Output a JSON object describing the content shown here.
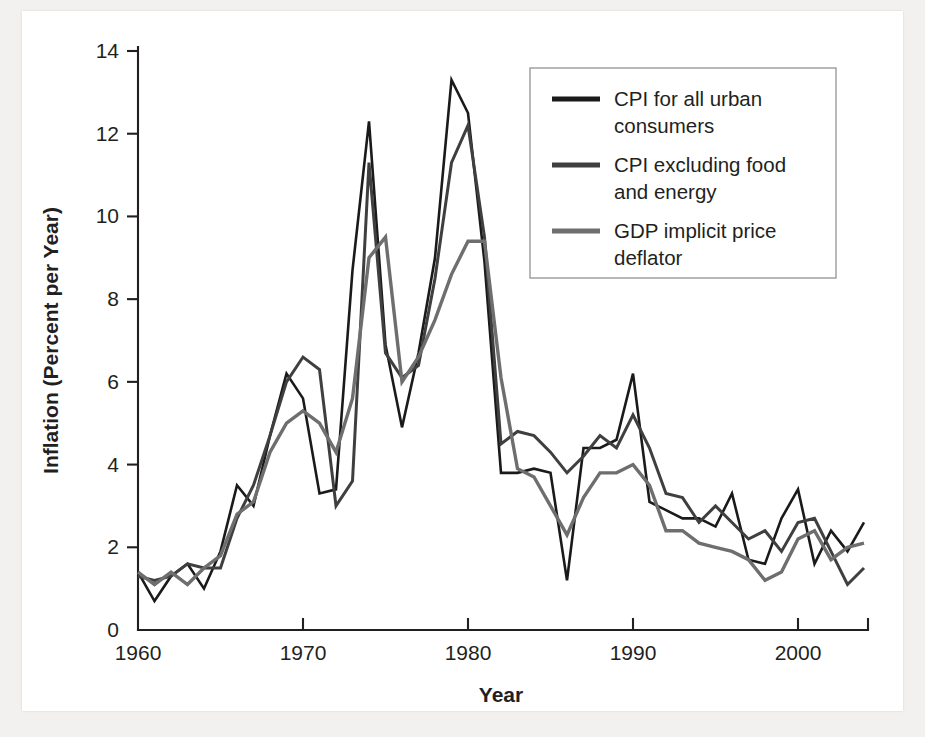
{
  "figure": {
    "background_color": "#f2f1ef",
    "plot_background_color": "#ffffff",
    "axis_color": "#231f20"
  },
  "chart_data": {
    "type": "line",
    "title": "",
    "xlabel": "Year",
    "ylabel": "Inflation (Percent per Year)",
    "xlim": [
      1960,
      2004
    ],
    "ylim": [
      0,
      14
    ],
    "xticks": [
      1960,
      1970,
      1980,
      1990,
      2000
    ],
    "xtick_labels": [
      "1960",
      "1970",
      "1980",
      "1990",
      "2000"
    ],
    "yticks": [
      0,
      2,
      4,
      6,
      8,
      10,
      12,
      14
    ],
    "ytick_labels": [
      "0",
      "2",
      "4",
      "6",
      "8",
      "10",
      "12",
      "14"
    ],
    "grid": false,
    "legend_position": "upper right",
    "x": [
      1960,
      1961,
      1962,
      1963,
      1964,
      1965,
      1966,
      1967,
      1968,
      1969,
      1970,
      1971,
      1972,
      1973,
      1974,
      1975,
      1976,
      1977,
      1978,
      1979,
      1980,
      1981,
      1982,
      1983,
      1984,
      1985,
      1986,
      1987,
      1988,
      1989,
      1990,
      1991,
      1992,
      1993,
      1994,
      1995,
      1996,
      1997,
      1998,
      1999,
      2000,
      2001,
      2002,
      2003,
      2004
    ],
    "series": [
      {
        "name": "CPI for all urban consumers",
        "color": "#1a1a1a",
        "width": 2.6,
        "values": [
          1.4,
          0.7,
          1.3,
          1.6,
          1.0,
          1.9,
          3.5,
          3.0,
          4.7,
          6.2,
          5.6,
          3.3,
          3.4,
          8.7,
          12.3,
          6.9,
          4.9,
          6.7,
          9.0,
          13.3,
          12.5,
          8.9,
          3.8,
          3.8,
          3.9,
          3.8,
          1.2,
          4.4,
          4.4,
          4.6,
          6.2,
          3.1,
          2.9,
          2.7,
          2.7,
          2.5,
          3.3,
          1.7,
          1.6,
          2.7,
          3.4,
          1.6,
          2.4,
          1.9,
          2.6
        ]
      },
      {
        "name": "CPI excluding food and energy",
        "color": "#3f3f3f",
        "width": 3.0,
        "values": [
          1.3,
          1.2,
          1.3,
          1.6,
          1.5,
          1.5,
          2.7,
          3.5,
          4.7,
          6.0,
          6.6,
          6.3,
          3.0,
          3.6,
          11.3,
          6.7,
          6.1,
          6.4,
          8.5,
          11.3,
          12.2,
          9.5,
          4.5,
          4.8,
          4.7,
          4.3,
          3.8,
          4.2,
          4.7,
          4.4,
          5.2,
          4.4,
          3.3,
          3.2,
          2.6,
          3.0,
          2.6,
          2.2,
          2.4,
          1.9,
          2.6,
          2.7,
          1.9,
          1.1,
          1.5
        ]
      },
      {
        "name": "GDP implicit price deflator",
        "color": "#6e6e6e",
        "width": 3.4,
        "values": [
          1.4,
          1.1,
          1.4,
          1.1,
          1.5,
          1.8,
          2.8,
          3.1,
          4.3,
          5.0,
          5.3,
          5.0,
          4.3,
          5.6,
          9.0,
          9.5,
          6.0,
          6.6,
          7.5,
          8.6,
          9.4,
          9.4,
          6.1,
          3.9,
          3.7,
          3.0,
          2.3,
          3.2,
          3.8,
          3.8,
          4.0,
          3.5,
          2.4,
          2.4,
          2.1,
          2.0,
          1.9,
          1.7,
          1.2,
          1.4,
          2.2,
          2.4,
          1.7,
          2.0,
          2.1
        ]
      }
    ],
    "legend": [
      {
        "label_line1": "CPI for all urban",
        "label_line2": "consumers",
        "color": "#1a1a1a"
      },
      {
        "label_line1": "CPI excluding food",
        "label_line2": "and energy",
        "color": "#3f3f3f"
      },
      {
        "label_line1": "GDP implicit price",
        "label_line2": "deflator",
        "color": "#6e6e6e"
      }
    ]
  }
}
